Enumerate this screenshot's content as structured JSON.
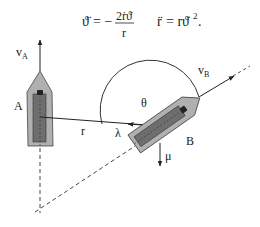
{
  "equations": {
    "eq1_lhs": "ϑ̈",
    "eq1_equals": "= −",
    "eq1_numerator": "2ṙϑ̇",
    "eq1_denominator": "r",
    "eq2": "r̈ = rϑ̇².",
    "eq2_lhs": "r̈",
    "eq2_rhs": "= rϑ̇",
    "eq2_exp": "2",
    "eq2_end": "."
  },
  "labels": {
    "vA_main": "v",
    "vA_sub": "A",
    "vB_main": "v",
    "vB_sub": "B",
    "boatA": "A",
    "boatB": "B",
    "r": "r",
    "lambda": "λ",
    "theta": "θ",
    "mu": "μ"
  },
  "colors": {
    "hull_outer": "#b0b0b0",
    "hull_inner": "#6e6e6e",
    "line": "#333333",
    "cabin": "#222222"
  }
}
